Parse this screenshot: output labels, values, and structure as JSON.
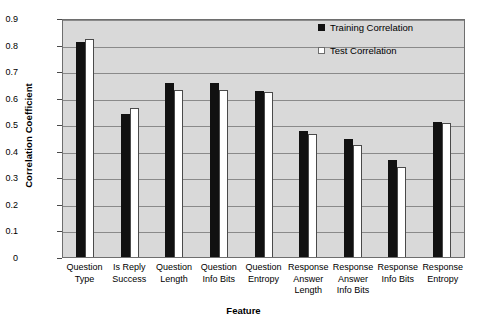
{
  "chart_data": {
    "type": "bar",
    "title": "",
    "xlabel": "Feature",
    "ylabel": "Correlation Coefficient",
    "ylim": [
      0,
      0.9
    ],
    "ytick_labels": [
      "0.9",
      "0.8",
      "0.7",
      "0.6",
      "0.5",
      "0.4",
      "0.3",
      "0.2",
      "0.1",
      "0"
    ],
    "ytick_values": [
      0.9,
      0.8,
      0.7,
      0.6,
      0.5,
      0.4,
      0.3,
      0.2,
      0.1,
      0
    ],
    "grid": true,
    "legend_position": "top-right",
    "categories": [
      "Question Type",
      "Is Reply Success",
      "Question Length",
      "Question Info Bits",
      "Question Entropy",
      "Response Answer Length",
      "Response Answer Info Bits",
      "Response Info Bits",
      "Response Entropy"
    ],
    "category_lines": [
      [
        "Question",
        "Type"
      ],
      [
        "Is Reply",
        "Success"
      ],
      [
        "Question",
        "Length"
      ],
      [
        "Question",
        "Info Bits"
      ],
      [
        "Question",
        "Entropy"
      ],
      [
        "Response",
        "Answer",
        "Length"
      ],
      [
        "Response",
        "Answer",
        "Info Bits"
      ],
      [
        "Response",
        "Info Bits"
      ],
      [
        "Response",
        "Entropy"
      ]
    ],
    "series": [
      {
        "name": "Training Correlation",
        "color": "#111111",
        "values": [
          0.81,
          0.54,
          0.655,
          0.655,
          0.625,
          0.475,
          0.445,
          0.365,
          0.51
        ]
      },
      {
        "name": "Test Correlation",
        "color": "#ffffff",
        "values": [
          0.82,
          0.56,
          0.63,
          0.63,
          0.62,
          0.465,
          0.42,
          0.34,
          0.505
        ]
      }
    ]
  },
  "legend": {
    "items": [
      {
        "label": "Training Correlation",
        "type": "train"
      },
      {
        "label": "Test Correlation",
        "type": "test"
      }
    ]
  },
  "axes": {
    "y_title": "Correlation Coefficient",
    "x_title": "Feature"
  }
}
